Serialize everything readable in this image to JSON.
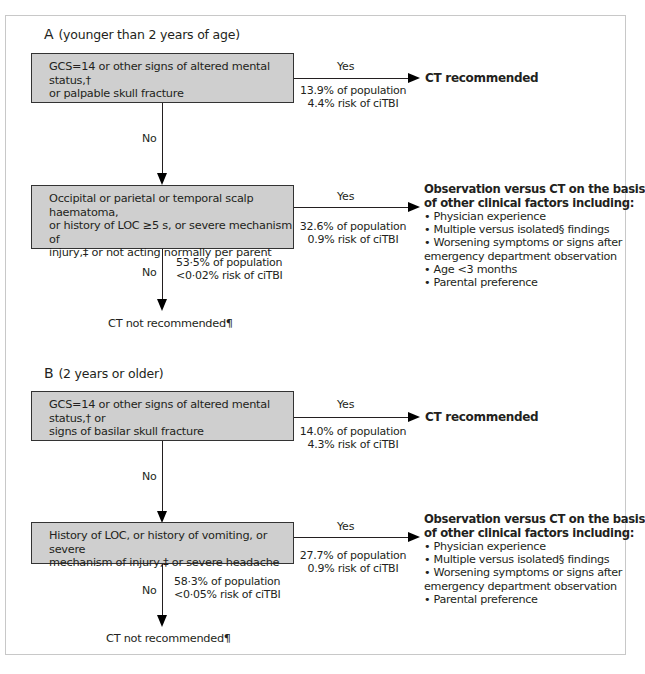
{
  "panel_a": {
    "letter": "A",
    "subtitle": "(younger than 2 years of age)",
    "box1": {
      "line1": "GCS=14 or other signs of altered mental status,†",
      "line2": "or palpable skull fracture"
    },
    "box1_yes": {
      "label": "Yes",
      "population": "13.9% of population",
      "risk": "4.4% risk of ciTBI",
      "outcome": "CT recommended"
    },
    "box1_no_label": "No",
    "box2": {
      "line1": "Occipital or parietal or temporal scalp haematoma,",
      "line2": "or history of LOC ≥5 s, or severe mechanism of",
      "line3": "injury,‡ or not acting normally per parent"
    },
    "box2_yes": {
      "label": "Yes",
      "population": "32.6% of population",
      "risk": "0.9% risk of ciTBI"
    },
    "box2_no": {
      "label": "No",
      "population": "53·5% of population",
      "risk": "<0·02% risk of ciTBI",
      "outcome": "CT not recommended¶"
    },
    "observation": {
      "heading_line1": "Observation versus CT on the basis",
      "heading_line2": "of other clinical factors including:",
      "items": [
        "• Physician experience",
        "• Multiple versus isolated§ findings",
        "• Worsening symptoms or signs after",
        "emergency department observation",
        "• Age <3 months",
        "• Parental preference"
      ]
    }
  },
  "panel_b": {
    "letter": "B",
    "subtitle": "(2 years or older)",
    "box1": {
      "line1": "GCS=14 or other signs of altered mental status,† or",
      "line2": "signs of basilar skull fracture"
    },
    "box1_yes": {
      "label": "Yes",
      "population": "14.0% of population",
      "risk": "4.3% risk of ciTBI",
      "outcome": "CT recommended"
    },
    "box1_no_label": "No",
    "box2": {
      "line1": "History of LOC, or history of vomiting, or severe",
      "line2": "mechanism of injury,‡ or severe headache"
    },
    "box2_yes": {
      "label": "Yes",
      "population": "27.7% of population",
      "risk": "0.9% risk of ciTBI"
    },
    "box2_no": {
      "label": "No",
      "population": "58·3% of population",
      "risk": "<0·05% risk of ciTBI",
      "outcome": "CT not recommended¶"
    },
    "observation": {
      "heading_line1": "Observation versus CT on the basis",
      "heading_line2": "of other clinical factors including:",
      "items": [
        "• Physician experience",
        "• Multiple versus isolated§ findings",
        "• Worsening symptoms or signs after",
        "emergency department observation",
        "• Parental preference"
      ]
    }
  },
  "colors": {
    "box_fill": "#cfcfcf",
    "box_border": "#333333",
    "line": "#231f20",
    "frame": "#c8c8c8"
  }
}
